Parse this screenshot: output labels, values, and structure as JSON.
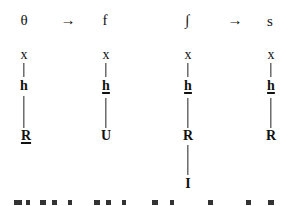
{
  "mappings": [
    {
      "source": "θ",
      "arrow": "→",
      "target": "f"
    },
    {
      "source": "∫",
      "arrow": "→",
      "target": "s"
    }
  ],
  "trees": [
    {
      "top": "x",
      "mid": "h",
      "mid_underlined": false,
      "bottom": "R",
      "bottom_underlined": true,
      "extra": null
    },
    {
      "top": "x",
      "mid": "h",
      "mid_underlined": true,
      "bottom": "U",
      "bottom_underlined": false,
      "extra": null
    },
    {
      "top": "x",
      "mid": "h",
      "mid_underlined": true,
      "bottom": "R",
      "bottom_underlined": false,
      "extra": "I"
    },
    {
      "top": "x",
      "mid": "h",
      "mid_underlined": true,
      "bottom": "R",
      "bottom_underlined": false,
      "extra": null
    }
  ],
  "footer_text_cut_off": true
}
